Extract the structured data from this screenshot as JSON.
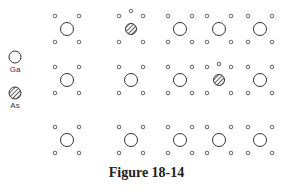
{
  "figure": {
    "caption": "Figure 18-14",
    "legend": [
      {
        "symbol": "open-circle",
        "label": "Ga",
        "x": 15,
        "y": 57
      },
      {
        "symbol": "hatched-circle",
        "label": "As",
        "x": 15,
        "y": 93
      }
    ],
    "lattice": {
      "columns_x": [
        67,
        131,
        180,
        219,
        260
      ],
      "rows_y": [
        29,
        80,
        140
      ],
      "corner_dx": 12,
      "corner_dy": 13,
      "cells": [
        [
          "Ga",
          "As",
          "Ga",
          "Ga",
          "Ga"
        ],
        [
          "Ga",
          "Ga",
          "Ga",
          "As",
          "Ga"
        ],
        [
          "Ga",
          "Ga",
          "Ga",
          "Ga",
          "Ga"
        ]
      ],
      "extra_small_atoms": [
        {
          "x": 131,
          "y": 11
        },
        {
          "x": 219,
          "y": 64
        }
      ]
    },
    "colors": {
      "stroke": "#333333",
      "small_stroke": "#555555",
      "background": "#ffffff"
    }
  }
}
